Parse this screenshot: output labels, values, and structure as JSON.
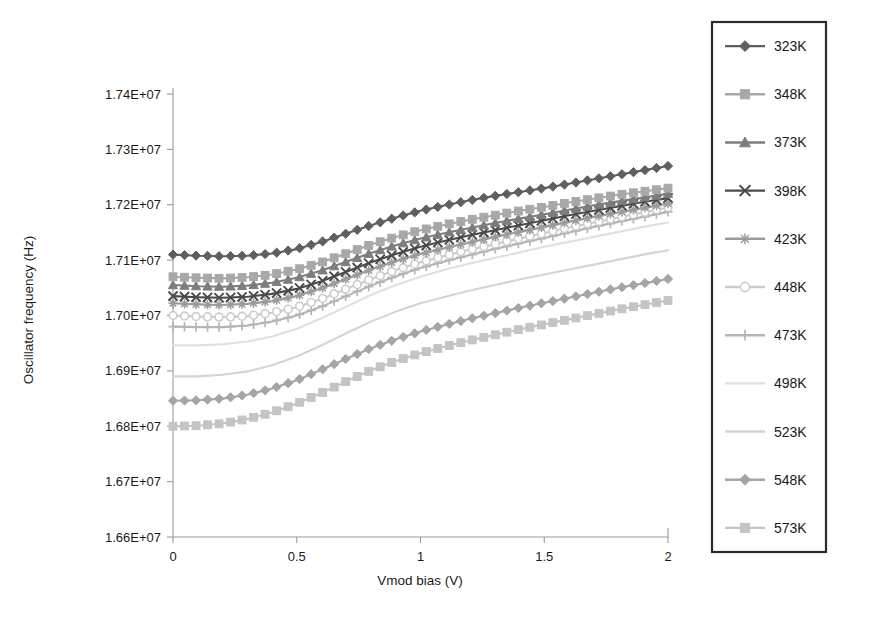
{
  "chart_data": {
    "type": "line",
    "title": "",
    "xlabel": "Vmod bias (V)",
    "ylabel": "Oscillator frequency (Hz)",
    "xlim": [
      0,
      2
    ],
    "ylim": [
      16600000,
      17400000
    ],
    "xticks": [
      0,
      0.5,
      1,
      1.5,
      2
    ],
    "xtick_labels": [
      "0",
      "0.5",
      "1",
      "1.5",
      "2"
    ],
    "yticks": [
      16600000,
      16700000,
      16800000,
      16900000,
      17000000,
      17100000,
      17200000,
      17300000,
      17400000
    ],
    "ytick_labels": [
      "1.66E+07",
      "1.67E+07",
      "1.68E+07",
      "1.69E+07",
      "1.70E+07",
      "1.71E+07",
      "1.72E+07",
      "1.73E+07",
      "1.74E+07"
    ],
    "grid": false,
    "legend_position": "right-outside",
    "x": [
      0,
      0.1,
      0.2,
      0.3,
      0.4,
      0.5,
      0.6,
      0.7,
      0.8,
      0.9,
      1.0,
      1.1,
      1.2,
      1.3,
      1.4,
      1.5,
      1.6,
      1.7,
      1.8,
      1.9,
      2.0
    ],
    "series": [
      {
        "name": "323K",
        "color": "#5f5f5f",
        "marker": "diamond",
        "values": [
          17110000,
          17108000,
          17107000,
          17108000,
          17112000,
          17120000,
          17133000,
          17148000,
          17163000,
          17177000,
          17189000,
          17199000,
          17208000,
          17216000,
          17223000,
          17230000,
          17238000,
          17246000,
          17254000,
          17262000,
          17270000
        ]
      },
      {
        "name": "348K",
        "color": "#a8a8a8",
        "marker": "square",
        "values": [
          17070000,
          17068000,
          17067000,
          17069000,
          17074000,
          17083000,
          17096000,
          17112000,
          17128000,
          17142000,
          17154000,
          17164000,
          17173000,
          17181000,
          17189000,
          17196000,
          17204000,
          17211000,
          17218000,
          17224000,
          17230000
        ]
      },
      {
        "name": "373K",
        "color": "#7d7d7d",
        "marker": "triangle",
        "values": [
          17055000,
          17053000,
          17052000,
          17054000,
          17059000,
          17068000,
          17081000,
          17097000,
          17113000,
          17127000,
          17139000,
          17149000,
          17158000,
          17167000,
          17175000,
          17183000,
          17191000,
          17199000,
          17206000,
          17213000,
          17220000
        ]
      },
      {
        "name": "398K",
        "color": "#4a4a4a",
        "marker": "x",
        "values": [
          17035000,
          17033000,
          17032000,
          17034000,
          17039000,
          17048000,
          17062000,
          17079000,
          17096000,
          17111000,
          17124000,
          17135000,
          17145000,
          17154000,
          17163000,
          17172000,
          17181000,
          17189000,
          17197000,
          17205000,
          17212000
        ]
      },
      {
        "name": "423K",
        "color": "#9b9b9b",
        "marker": "star",
        "values": [
          17022000,
          17020000,
          17019000,
          17021000,
          17026000,
          17035000,
          17049000,
          17066000,
          17083000,
          17098000,
          17111000,
          17122000,
          17132000,
          17142000,
          17151000,
          17160000,
          17169000,
          17178000,
          17186000,
          17194000,
          17202000
        ]
      },
      {
        "name": "448K",
        "color": "#cccccc",
        "marker": "circle",
        "values": [
          17000000,
          16998000,
          16997000,
          16999000,
          17005000,
          17015000,
          17030000,
          17048000,
          17066000,
          17082000,
          17096000,
          17108000,
          17119000,
          17129000,
          17139000,
          17149000,
          17159000,
          17168000,
          17177000,
          17186000,
          17195000
        ]
      },
      {
        "name": "473K",
        "color": "#b5b5b5",
        "marker": "plus",
        "values": [
          16980000,
          16979000,
          16979000,
          16982000,
          16989000,
          17000000,
          17016000,
          17035000,
          17054000,
          17071000,
          17086000,
          17098000,
          17109000,
          17120000,
          17130000,
          17140000,
          17150000,
          17160000,
          17169000,
          17178000,
          17187000
        ]
      },
      {
        "name": "498K",
        "color": "#e0e0e0",
        "marker": "none",
        "values": [
          16946000,
          16946000,
          16948000,
          16953000,
          16962000,
          16976000,
          16995000,
          17016000,
          17037000,
          17055000,
          17070000,
          17083000,
          17094000,
          17104000,
          17114000,
          17124000,
          17133000,
          17142000,
          17151000,
          17160000,
          17168000
        ]
      },
      {
        "name": "523K",
        "color": "#d4d4d4",
        "marker": "none",
        "values": [
          16890000,
          16890000,
          16893000,
          16899000,
          16910000,
          16926000,
          16946000,
          16968000,
          16989000,
          17007000,
          17022000,
          17034000,
          17045000,
          17055000,
          17065000,
          17074000,
          17083000,
          17092000,
          17101000,
          17110000,
          17118000
        ]
      },
      {
        "name": "548K",
        "color": "#a5a5a5",
        "marker": "diamond",
        "values": [
          16846000,
          16847000,
          16850000,
          16857000,
          16868000,
          16883000,
          16902000,
          16922000,
          16941000,
          16957000,
          16971000,
          16983000,
          16994000,
          17004000,
          17014000,
          17023000,
          17032000,
          17041000,
          17050000,
          17058000,
          17066000
        ]
      },
      {
        "name": "573K",
        "color": "#c4c4c4",
        "marker": "square",
        "values": [
          16800000,
          16801000,
          16805000,
          16813000,
          16825000,
          16841000,
          16860000,
          16881000,
          16901000,
          16918000,
          16932000,
          16944000,
          16955000,
          16965000,
          16975000,
          16984000,
          16993000,
          17002000,
          17011000,
          17019000,
          17027000
        ]
      }
    ]
  },
  "legend": {
    "entries": [
      {
        "label": "323K"
      },
      {
        "label": "348K"
      },
      {
        "label": "373K"
      },
      {
        "label": "398K"
      },
      {
        "label": "423K"
      },
      {
        "label": "448K"
      },
      {
        "label": "473K"
      },
      {
        "label": "498K"
      },
      {
        "label": "523K"
      },
      {
        "label": "548K"
      },
      {
        "label": "573K"
      }
    ]
  }
}
